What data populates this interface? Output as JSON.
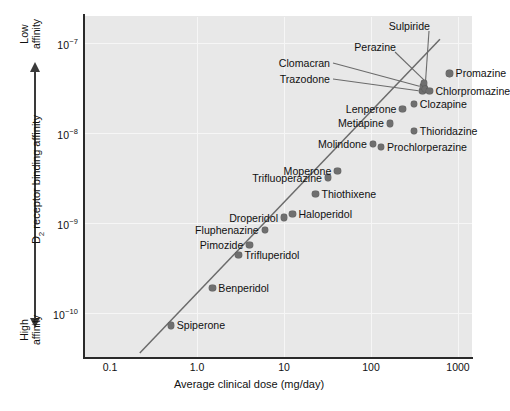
{
  "chart_data": {
    "type": "scatter",
    "title": "",
    "xlabel": "Average clinical dose (mg/day)",
    "ylabel": "D2 receptor binding affinity",
    "ylabel_sub": "2",
    "ylabel_prefix": "D",
    "ylabel_suffix": " receptor binding affinity",
    "xscale": "log",
    "yscale": "log",
    "xlim": [
      0.1,
      1600
    ],
    "ylim": [
      4e-11,
      2.2e-07
    ],
    "grid": true,
    "legend": null,
    "xticks": [
      {
        "value": 0.1,
        "label": "0.1"
      },
      {
        "value": 1.0,
        "label": "1.0"
      },
      {
        "value": 10,
        "label": "10"
      },
      {
        "value": 100,
        "label": "100"
      },
      {
        "value": 1000,
        "label": "1000"
      }
    ],
    "yticks": [
      {
        "value": 1e-07,
        "mantissa": "10",
        "exponent": "−7"
      },
      {
        "value": 1e-08,
        "mantissa": "10",
        "exponent": "−8"
      },
      {
        "value": 1e-09,
        "mantissa": "10",
        "exponent": "−9"
      },
      {
        "value": 1e-10,
        "mantissa": "10",
        "exponent": "−10"
      }
    ],
    "axis_annotations": {
      "top": "Low\naffinity",
      "top_line1": "Low",
      "top_line2": "affinity",
      "bottom_line1": "High",
      "bottom_line2": "affinity"
    },
    "colors": {
      "plot_background": "#e8e8e8",
      "grid": "#f6f6f6",
      "marker": "#6f6f6f",
      "axis": "#2a2a2a",
      "trend_line": "#6b6b6b",
      "text": "#111111"
    },
    "trend_line": {
      "x1": 0.22,
      "y1": 3.6e-11,
      "x2": 620,
      "y2": 1.1e-07
    },
    "points": [
      {
        "name": "Spiperone",
        "x": 0.5,
        "y": 7.3e-11,
        "label_pos": "right"
      },
      {
        "name": "Benperidol",
        "x": 1.5,
        "y": 1.9e-10,
        "label_pos": "right"
      },
      {
        "name": "Trifluperidol",
        "x": 3.0,
        "y": 4.4e-10,
        "label_pos": "right"
      },
      {
        "name": "Pimozide",
        "x": 4.0,
        "y": 5.7e-10,
        "label_pos": "left"
      },
      {
        "name": "Fluphenazine",
        "x": 6.0,
        "y": 8.3e-10,
        "label_pos": "left"
      },
      {
        "name": "Droperidol",
        "x": 10.0,
        "y": 1.15e-09,
        "label_pos": "left"
      },
      {
        "name": "Haloperidol",
        "x": 12.5,
        "y": 1.25e-09,
        "label_pos": "right"
      },
      {
        "name": "Thiothixene",
        "x": 23,
        "y": 2.1e-09,
        "label_pos": "right"
      },
      {
        "name": "Trifluoperazine",
        "x": 32,
        "y": 3.2e-09,
        "label_pos": "left"
      },
      {
        "name": "Moperone",
        "x": 41,
        "y": 3.8e-09,
        "label_pos": "left"
      },
      {
        "name": "Molindone",
        "x": 105,
        "y": 7.6e-09,
        "label_pos": "left"
      },
      {
        "name": "Prochlorperazine",
        "x": 130,
        "y": 7e-09,
        "label_pos": "right"
      },
      {
        "name": "Metiapine",
        "x": 165,
        "y": 1.28e-08,
        "label_pos": "left"
      },
      {
        "name": "Thioridazine",
        "x": 310,
        "y": 1.05e-08,
        "label_pos": "right"
      },
      {
        "name": "Lenperone",
        "x": 230,
        "y": 1.85e-08,
        "label_pos": "left"
      },
      {
        "name": "Clozapine",
        "x": 310,
        "y": 2.1e-08,
        "label_pos": "right"
      },
      {
        "name": "Trazodone",
        "x": 390,
        "y": 2.95e-08,
        "label_pos": "leader-left"
      },
      {
        "name": "Clomacran",
        "x": 400,
        "y": 3.3e-08,
        "label_pos": "leader-left"
      },
      {
        "name": "Perazine",
        "x": 405,
        "y": 3.6e-08,
        "label_pos": "leader-up"
      },
      {
        "name": "Sulpiride",
        "x": 420,
        "y": 3.1e-08,
        "label_pos": "leader-up"
      },
      {
        "name": "Chlorpromazine",
        "x": 470,
        "y": 2.95e-08,
        "label_pos": "right"
      },
      {
        "name": "Promazine",
        "x": 800,
        "y": 4.6e-08,
        "label_pos": "right"
      }
    ]
  }
}
